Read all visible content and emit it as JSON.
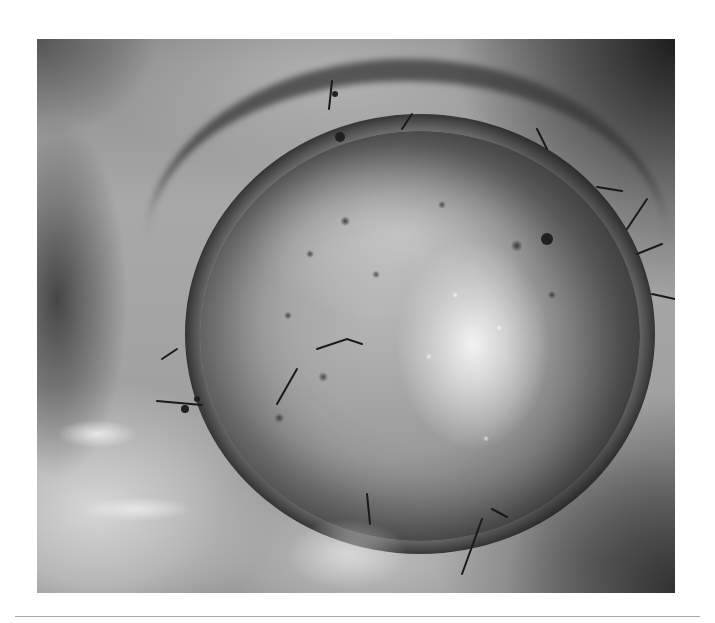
{
  "figure": {
    "type": "grayscale clinical photograph",
    "colors": {
      "page_background": "#ffffff",
      "divider": "#a9a9a9"
    }
  }
}
